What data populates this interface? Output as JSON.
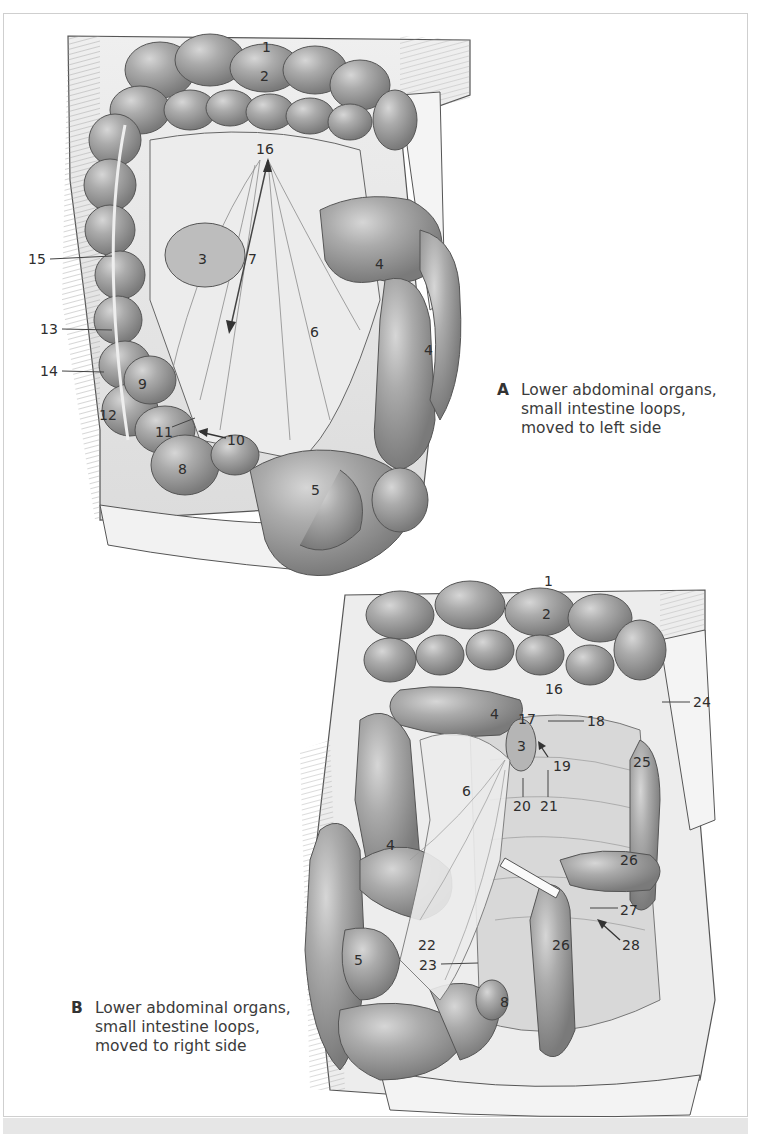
{
  "figures": [
    {
      "id": "A",
      "letter": "A",
      "caption_lines": [
        "Lower abdominal organs,",
        "small intestine loops,",
        "moved to left side"
      ],
      "labels": [
        {
          "text": "1",
          "x": 262,
          "y": 40
        },
        {
          "text": "2",
          "x": 260,
          "y": 69
        },
        {
          "text": "16",
          "x": 256,
          "y": 142
        },
        {
          "text": "15",
          "x": 28,
          "y": 254
        },
        {
          "text": "3",
          "x": 198,
          "y": 252
        },
        {
          "text": "7",
          "x": 248,
          "y": 252
        },
        {
          "text": "4",
          "x": 375,
          "y": 257
        },
        {
          "text": "13",
          "x": 40,
          "y": 324
        },
        {
          "text": "6",
          "x": 310,
          "y": 325
        },
        {
          "text": "4",
          "x": 424,
          "y": 343
        },
        {
          "text": "14",
          "x": 40,
          "y": 366
        },
        {
          "text": "9",
          "x": 138,
          "y": 377
        },
        {
          "text": "12",
          "x": 99,
          "y": 408
        },
        {
          "text": "11",
          "x": 155,
          "y": 425
        },
        {
          "text": "10",
          "x": 227,
          "y": 433
        },
        {
          "text": "8",
          "x": 178,
          "y": 462
        },
        {
          "text": "5",
          "x": 311,
          "y": 483
        }
      ]
    },
    {
      "id": "B",
      "letter": "B",
      "caption_lines": [
        "Lower abdominal organs,",
        "small intestine loops,",
        "moved to right side"
      ],
      "labels": [
        {
          "text": "1",
          "x": 544,
          "y": 574
        },
        {
          "text": "2",
          "x": 542,
          "y": 607
        },
        {
          "text": "16",
          "x": 545,
          "y": 682
        },
        {
          "text": "24",
          "x": 693,
          "y": 697
        },
        {
          "text": "4",
          "x": 490,
          "y": 707
        },
        {
          "text": "17",
          "x": 518,
          "y": 712
        },
        {
          "text": "18",
          "x": 587,
          "y": 716
        },
        {
          "text": "3",
          "x": 517,
          "y": 739
        },
        {
          "text": "25",
          "x": 633,
          "y": 755
        },
        {
          "text": "19",
          "x": 553,
          "y": 759
        },
        {
          "text": "6",
          "x": 462,
          "y": 784
        },
        {
          "text": "20",
          "x": 513,
          "y": 799
        },
        {
          "text": "21",
          "x": 540,
          "y": 799
        },
        {
          "text": "4",
          "x": 386,
          "y": 838
        },
        {
          "text": "26",
          "x": 620,
          "y": 853
        },
        {
          "text": "27",
          "x": 620,
          "y": 903
        },
        {
          "text": "22",
          "x": 418,
          "y": 938
        },
        {
          "text": "26",
          "x": 552,
          "y": 938
        },
        {
          "text": "28",
          "x": 622,
          "y": 938
        },
        {
          "text": "5",
          "x": 354,
          "y": 953
        },
        {
          "text": "23",
          "x": 419,
          "y": 960
        },
        {
          "text": "8",
          "x": 500,
          "y": 995
        }
      ]
    }
  ],
  "colors": {
    "frame_border": "#cfcfcf",
    "bottom_strip": "#e6e6e6",
    "organ_fill": "#a9a9a9",
    "organ_dark": "#7d7d7d",
    "tissue_fill": "#e8e8e8",
    "line": "#4a4a4a"
  }
}
